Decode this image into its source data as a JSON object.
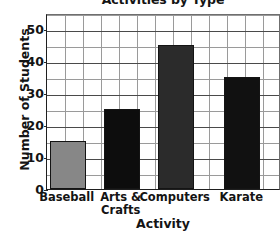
{
  "chart_data": {
    "type": "bar",
    "title": "Activities by Type",
    "xlabel": "Activity",
    "ylabel": "Number of Students",
    "categories": [
      "Baseball",
      "Arts &\nCrafts",
      "Computers",
      "Karate"
    ],
    "values": [
      15,
      25,
      45,
      35
    ],
    "bar_colors": [
      "#878787",
      "#0d0d0d",
      "#2b2b2b",
      "#111111"
    ],
    "ylim": [
      0,
      55
    ],
    "yticks": [
      0,
      10,
      20,
      30,
      40,
      50
    ],
    "ytick_labels": [
      "0",
      "10",
      "20",
      "30",
      "40",
      "50"
    ],
    "gridline_step": 5,
    "grid": true,
    "legend": "none",
    "axis_line_color": "#1f1f1f",
    "grid_color": "#9a9a9a"
  }
}
